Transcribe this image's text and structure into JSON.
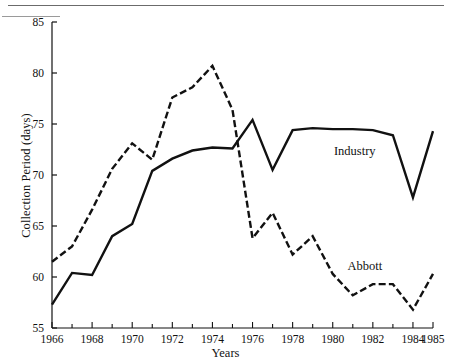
{
  "figure": {
    "ylabel": "Collection Period (days)",
    "xlabel": "Years"
  },
  "chart_data": {
    "type": "line",
    "title": "",
    "xlabel": "Years",
    "ylabel": "Collection Period (days)",
    "xlim": [
      1966,
      1985
    ],
    "ylim": [
      55,
      85
    ],
    "ytick_labels": [
      "55",
      "60",
      "65",
      "70",
      "75",
      "80",
      "85"
    ],
    "yticks": [
      55,
      60,
      65,
      70,
      75,
      80,
      85
    ],
    "xtick_labels": [
      "1966",
      "1968",
      "1970",
      "1972",
      "1974",
      "1976",
      "1978",
      "1980",
      "1982",
      "1984",
      "1985"
    ],
    "xticks_major": [
      1966,
      1968,
      1970,
      1972,
      1974,
      1976,
      1978,
      1980,
      1982,
      1984,
      1985
    ],
    "xticks_minor": [
      1967,
      1969,
      1971,
      1973,
      1975,
      1977,
      1979,
      1981,
      1983
    ],
    "grid": false,
    "legend_position": "inline-annotations",
    "x": [
      1966,
      1967,
      1968,
      1969,
      1970,
      1971,
      1972,
      1973,
      1974,
      1975,
      1976,
      1977,
      1978,
      1979,
      1980,
      1981,
      1982,
      1983,
      1984,
      1985
    ],
    "series": [
      {
        "name": "Abbott",
        "style": "dashed",
        "color": "#111111",
        "label_text": "Abbott",
        "values": [
          61.5,
          63.0,
          66.6,
          70.6,
          73.1,
          71.5,
          77.6,
          78.6,
          80.7,
          76.4,
          63.8,
          66.3,
          62.2,
          64.0,
          60.3,
          58.2,
          59.3,
          59.3,
          56.8,
          60.3
        ]
      },
      {
        "name": "Industry",
        "style": "solid",
        "color": "#111111",
        "label_text": "Industry",
        "values": [
          57.3,
          60.4,
          60.2,
          64.0,
          65.2,
          70.4,
          71.6,
          72.4,
          72.7,
          72.6,
          75.4,
          70.5,
          74.4,
          74.6,
          74.5,
          74.5,
          74.4,
          73.9,
          67.8,
          74.3
        ]
      }
    ],
    "annotations": [
      {
        "text": "Industry",
        "x": 1981.1,
        "y": 72.0
      },
      {
        "text": "Abbott",
        "x": 1981.6,
        "y": 60.7
      }
    ]
  }
}
